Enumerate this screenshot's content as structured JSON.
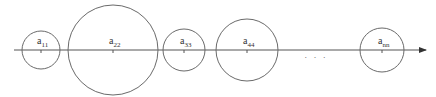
{
  "diagram": {
    "type": "circles-on-axis",
    "axis": {
      "y": 50,
      "x_start": 14,
      "x_end": 426,
      "arrow": true
    },
    "circles": [
      {
        "id": "a11",
        "label_base": "a",
        "label_sub": "11",
        "cx": 41,
        "r": 19
      },
      {
        "id": "a22",
        "label_base": "a",
        "label_sub": "22",
        "cx": 113,
        "r": 45
      },
      {
        "id": "a33",
        "label_base": "a",
        "label_sub": "33",
        "cx": 184,
        "r": 21
      },
      {
        "id": "a44",
        "label_base": "a",
        "label_sub": "44",
        "cx": 247,
        "r": 31
      },
      {
        "id": "ann",
        "label_base": "a",
        "label_sub": "nn",
        "cx": 382,
        "r": 22
      }
    ],
    "ellipsis": {
      "text": "· · ·",
      "x": 316,
      "y": 60
    },
    "colors": {
      "stroke": "#6a6a6a",
      "axis": "#555555",
      "text": "#333333"
    }
  }
}
